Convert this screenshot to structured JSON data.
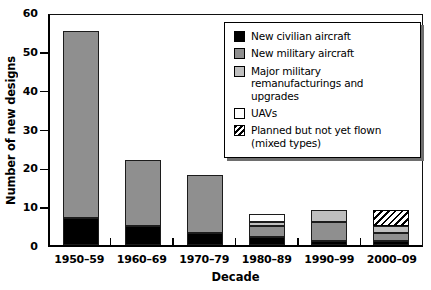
{
  "chart_data": {
    "type": "bar",
    "stacked": true,
    "title": "",
    "xlabel": "Decade",
    "ylabel": "Number of new designs",
    "ylim": [
      0,
      60
    ],
    "yticks": [
      0,
      10,
      20,
      30,
      40,
      50,
      60
    ],
    "grid": false,
    "legend_position": "top-right",
    "categories": [
      "1950–59",
      "1960–69",
      "1970–79",
      "1980–89",
      "1990–99",
      "2000–09"
    ],
    "series": [
      {
        "name": "New civilian aircraft",
        "color": "#000000",
        "pattern": "solid",
        "values": [
          7,
          5,
          3,
          2,
          1,
          1
        ]
      },
      {
        "name": "New military aircraft",
        "color": "#8f8f8f",
        "pattern": "solid",
        "values": [
          48,
          17,
          15,
          3,
          5,
          2
        ]
      },
      {
        "name": "Major military remanufacturings and upgrades",
        "color": "#bfbfbf",
        "pattern": "solid",
        "values": [
          0,
          0,
          0,
          1,
          3,
          2
        ]
      },
      {
        "name": "UAVs",
        "color": "#ffffff",
        "pattern": "solid",
        "values": [
          0,
          0,
          0,
          2,
          0,
          0
        ]
      },
      {
        "name": "Planned but not yet flown (mixed types)",
        "color": "#ffffff",
        "pattern": "diagonal-hatch",
        "values": [
          0,
          0,
          0,
          0,
          0,
          4
        ]
      }
    ],
    "totals": [
      55,
      22,
      18,
      8,
      9,
      9
    ]
  }
}
